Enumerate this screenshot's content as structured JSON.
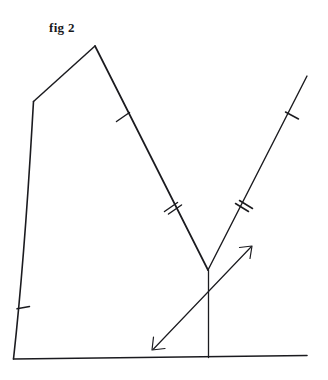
{
  "figure": {
    "caption": "fig 2",
    "caption_position": {
      "x": 49,
      "y": 20
    },
    "background_color": "#ffffff",
    "ink_color": "#1b1b1f",
    "canvas": {
      "width": 328,
      "height": 380
    },
    "style": "hand-drawn geometry sketch, black ink on white paper"
  },
  "geometry": {
    "points": {
      "apex": {
        "x": 95,
        "y": 46,
        "label": "apex-top"
      },
      "upper_left": {
        "x": 33,
        "y": 101,
        "label": "upper-left-vertex"
      },
      "bottom_left": {
        "x": 13,
        "y": 359,
        "label": "bottom-left-vertex"
      },
      "baseline_right": {
        "x": 307,
        "y": 355,
        "label": "baseline-right-end"
      },
      "v_vertex": {
        "x": 208,
        "y": 270,
        "label": "v-vertex"
      },
      "v_foot": {
        "x": 208,
        "y": 357,
        "label": "v-foot-on-baseline"
      },
      "ray_top_right": {
        "x": 307,
        "y": 76,
        "label": "right-ray-end"
      },
      "arrow_tip_lower_left": {
        "x": 152,
        "y": 350
      },
      "arrow_tip_upper_right": {
        "x": 252,
        "y": 246
      }
    },
    "segments": [
      {
        "name": "top-left-edge",
        "from": "upper_left",
        "to": "apex",
        "ticks": 0
      },
      {
        "name": "left-edge",
        "from": "upper_left",
        "to": "bottom_left",
        "ticks": 1,
        "curved": true
      },
      {
        "name": "baseline",
        "from": "bottom_left",
        "to": "baseline_right",
        "ticks": 0
      },
      {
        "name": "descending-edge",
        "from": "apex",
        "to": "v_vertex",
        "ticks": 3,
        "tick_groups": [
          1,
          2
        ]
      },
      {
        "name": "right-ray",
        "from": "v_vertex",
        "to": "ray_top_right",
        "ticks": 3,
        "tick_groups": [
          2,
          1
        ]
      },
      {
        "name": "vertical-drop",
        "from": "v_vertex",
        "to": "v_foot",
        "ticks": 0
      }
    ],
    "tick_marks": [
      {
        "name": "tick-left-edge",
        "x": 22,
        "y": 308,
        "count": 1,
        "on": "left-edge"
      },
      {
        "name": "tick-descending-upper",
        "x": 123,
        "y": 117,
        "count": 1,
        "on": "descending-edge"
      },
      {
        "name": "tick-descending-lower",
        "x": 172,
        "y": 207,
        "count": 2,
        "on": "descending-edge"
      },
      {
        "name": "tick-ray-lower",
        "x": 242,
        "y": 207,
        "count": 2,
        "on": "right-ray"
      },
      {
        "name": "tick-ray-upper",
        "x": 292,
        "y": 115,
        "count": 1,
        "on": "right-ray"
      }
    ],
    "arrows": [
      {
        "name": "double-headed-arrow",
        "from": {
          "x": 152,
          "y": 350
        },
        "to": {
          "x": 252,
          "y": 246
        },
        "heads": "both"
      }
    ]
  }
}
